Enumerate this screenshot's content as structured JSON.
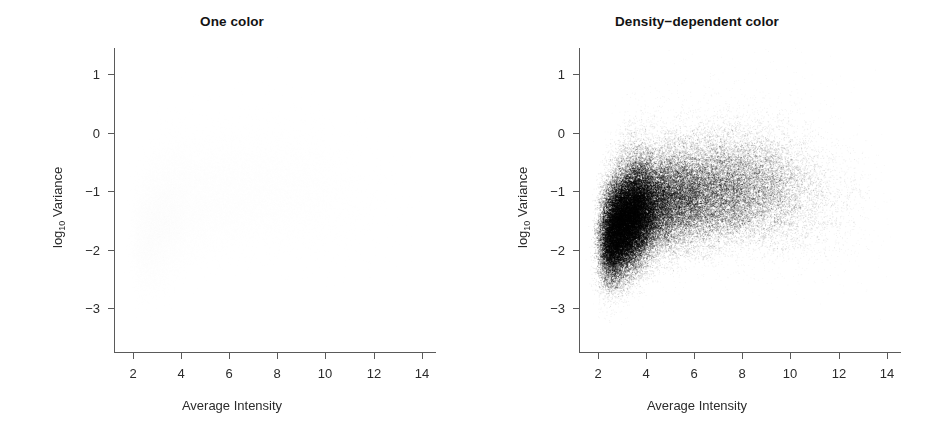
{
  "figure": {
    "width": 929,
    "height": 438,
    "background": "#ffffff",
    "panel_count": 2
  },
  "chart_data": [
    {
      "type": "scatter",
      "panel_index": 0,
      "title": "One color",
      "xlabel": "Average Intensity",
      "ylabel_text": "log10 Variance",
      "ylabel_base": "log",
      "ylabel_sub": "10",
      "ylabel_rest": " Variance",
      "xlim": [
        1.2,
        14.6
      ],
      "ylim": [
        -3.75,
        1.45
      ],
      "xticks": [
        2,
        4,
        6,
        8,
        10,
        12,
        14
      ],
      "xtick_labels": [
        "2",
        "4",
        "6",
        "8",
        "10",
        "12",
        "14"
      ],
      "yticks": [
        1,
        0,
        -1,
        -2,
        -3
      ],
      "ytick_labels": [
        "1",
        "0",
        "-1",
        "-2",
        "-3"
      ],
      "grid": false,
      "legend": "none",
      "point_color": "#000000",
      "point_alpha": 0.006,
      "point_radius_px": 1.0,
      "n_points": 45000,
      "render_mode": "uniform-alpha",
      "description": "Overplotted scatter of per-gene average intensity vs log10 variance; all points drawn in a single near-transparent black so the cloud appears as a uniform very pale gray blob with no visible internal structure.",
      "cloud_shape": {
        "x_mode": 3.4,
        "x_range": [
          2.1,
          13.2
        ],
        "ridge": [
          {
            "x": 2.2,
            "y": -1.95,
            "spread": 0.42,
            "weight": 0.55
          },
          {
            "x": 2.6,
            "y": -1.8,
            "spread": 0.44,
            "weight": 0.9
          },
          {
            "x": 3.0,
            "y": -1.62,
            "spread": 0.45,
            "weight": 1.0
          },
          {
            "x": 3.5,
            "y": -1.45,
            "spread": 0.46,
            "weight": 0.95
          },
          {
            "x": 4.0,
            "y": -1.32,
            "spread": 0.46,
            "weight": 0.8
          },
          {
            "x": 5.0,
            "y": -1.18,
            "spread": 0.47,
            "weight": 0.62
          },
          {
            "x": 6.0,
            "y": -1.1,
            "spread": 0.48,
            "weight": 0.52
          },
          {
            "x": 7.0,
            "y": -1.05,
            "spread": 0.49,
            "weight": 0.46
          },
          {
            "x": 8.0,
            "y": -1.02,
            "spread": 0.5,
            "weight": 0.38
          },
          {
            "x": 9.0,
            "y": -1.02,
            "spread": 0.52,
            "weight": 0.26
          },
          {
            "x": 10.0,
            "y": -1.05,
            "spread": 0.55,
            "weight": 0.15
          },
          {
            "x": 11.0,
            "y": -1.1,
            "spread": 0.58,
            "weight": 0.07
          },
          {
            "x": 12.0,
            "y": -1.18,
            "spread": 0.6,
            "weight": 0.03
          },
          {
            "x": 13.0,
            "y": -1.25,
            "spread": 0.62,
            "weight": 0.01
          }
        ]
      }
    },
    {
      "type": "scatter",
      "panel_index": 1,
      "title": "Density−dependent color",
      "xlabel": "Average Intensity",
      "ylabel_text": "log10 Variance",
      "ylabel_base": "log",
      "ylabel_sub": "10",
      "ylabel_rest": " Variance",
      "xlim": [
        1.2,
        14.6
      ],
      "ylim": [
        -3.75,
        1.45
      ],
      "xticks": [
        2,
        4,
        6,
        8,
        10,
        12,
        14
      ],
      "xtick_labels": [
        "2",
        "4",
        "6",
        "8",
        "10",
        "12",
        "14"
      ],
      "yticks": [
        1,
        0,
        -1,
        -2,
        -3
      ],
      "ytick_labels": [
        "1",
        "0",
        "-1",
        "-2",
        "-3"
      ],
      "grid": false,
      "legend": "none",
      "point_color": "#000000",
      "point_alpha": 0.05,
      "point_radius_px": 1.0,
      "n_points": 45000,
      "render_mode": "density-dependent-alpha",
      "density_peak": {
        "x": 3.3,
        "y": -1.45,
        "darkness": 0.72
      },
      "description": "Same data as the left panel but points are shaded by local density, revealing a comma-shaped high-density core near x=3, y=-1.5 that fades along a rising ridge toward x=8, y=-1.",
      "cloud_shape": {
        "x_mode": 3.4,
        "x_range": [
          2.1,
          13.2
        ],
        "ridge": [
          {
            "x": 2.2,
            "y": -1.95,
            "spread": 0.42,
            "weight": 0.55
          },
          {
            "x": 2.6,
            "y": -1.8,
            "spread": 0.44,
            "weight": 0.9
          },
          {
            "x": 3.0,
            "y": -1.62,
            "spread": 0.45,
            "weight": 1.0
          },
          {
            "x": 3.5,
            "y": -1.45,
            "spread": 0.46,
            "weight": 0.95
          },
          {
            "x": 4.0,
            "y": -1.32,
            "spread": 0.46,
            "weight": 0.8
          },
          {
            "x": 5.0,
            "y": -1.18,
            "spread": 0.47,
            "weight": 0.62
          },
          {
            "x": 6.0,
            "y": -1.1,
            "spread": 0.48,
            "weight": 0.52
          },
          {
            "x": 7.0,
            "y": -1.05,
            "spread": 0.49,
            "weight": 0.46
          },
          {
            "x": 8.0,
            "y": -1.02,
            "spread": 0.5,
            "weight": 0.38
          },
          {
            "x": 9.0,
            "y": -1.02,
            "spread": 0.52,
            "weight": 0.26
          },
          {
            "x": 10.0,
            "y": -1.05,
            "spread": 0.55,
            "weight": 0.15
          },
          {
            "x": 11.0,
            "y": -1.1,
            "spread": 0.58,
            "weight": 0.07
          },
          {
            "x": 12.0,
            "y": -1.18,
            "spread": 0.6,
            "weight": 0.03
          },
          {
            "x": 13.0,
            "y": -1.25,
            "spread": 0.62,
            "weight": 0.01
          }
        ]
      }
    }
  ],
  "geometry": {
    "panel_width": 464,
    "plot_left": 114,
    "plot_right": 436,
    "plot_top": 48,
    "plot_bottom": 352,
    "axis_color": "#5a5a5a"
  }
}
